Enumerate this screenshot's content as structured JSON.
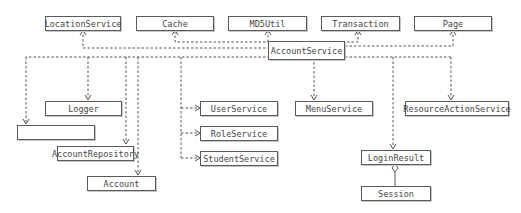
{
  "diagram": {
    "type": "uml-class-dependency",
    "nodes": {
      "location_service": "LocationService",
      "cache": "Cache",
      "md5util": "MD5Util",
      "transaction": "Transaction",
      "page": "Page",
      "account_service": "AccountService",
      "logger": "Logger",
      "notice_send": "NoticeSend",
      "account_repository": "AccountRepository",
      "account": "Account",
      "user_service": "UserService",
      "role_service": "RoleService",
      "student_service": "StudentService",
      "menu_service": "MenuService",
      "resource_action_service": "ResourceActionService",
      "login_result": "LoginResult",
      "session": "Session"
    },
    "edges": [
      {
        "from": "AccountService",
        "to": "LocationService",
        "style": "dashed",
        "arrow": "open"
      },
      {
        "from": "AccountService",
        "to": "Cache",
        "style": "dashed",
        "arrow": "open"
      },
      {
        "from": "AccountService",
        "to": "MD5Util",
        "style": "dashed",
        "arrow": "open"
      },
      {
        "from": "AccountService",
        "to": "Transaction",
        "style": "dashed",
        "arrow": "open"
      },
      {
        "from": "AccountService",
        "to": "Page",
        "style": "dashed",
        "arrow": "open"
      },
      {
        "from": "AccountService",
        "to": "Logger",
        "style": "dashed",
        "arrow": "open"
      },
      {
        "from": "AccountService",
        "to": "NoticeSend",
        "style": "dashed",
        "arrow": "open"
      },
      {
        "from": "AccountService",
        "to": "AccountRepository",
        "style": "dashed",
        "arrow": "open"
      },
      {
        "from": "AccountService",
        "to": "Account",
        "style": "dashed",
        "arrow": "open"
      },
      {
        "from": "AccountService",
        "to": "UserService",
        "style": "dashed",
        "arrow": "open"
      },
      {
        "from": "AccountService",
        "to": "RoleService",
        "style": "dashed",
        "arrow": "open"
      },
      {
        "from": "AccountService",
        "to": "StudentService",
        "style": "dashed",
        "arrow": "open"
      },
      {
        "from": "AccountService",
        "to": "MenuService",
        "style": "dashed",
        "arrow": "open"
      },
      {
        "from": "AccountService",
        "to": "ResourceActionService",
        "style": "dashed",
        "arrow": "open"
      },
      {
        "from": "AccountService",
        "to": "LoginResult",
        "style": "dashed",
        "arrow": "open"
      },
      {
        "from": "LoginResult",
        "to": "Session",
        "style": "solid",
        "arrow": "aggregation-diamond"
      }
    ]
  }
}
